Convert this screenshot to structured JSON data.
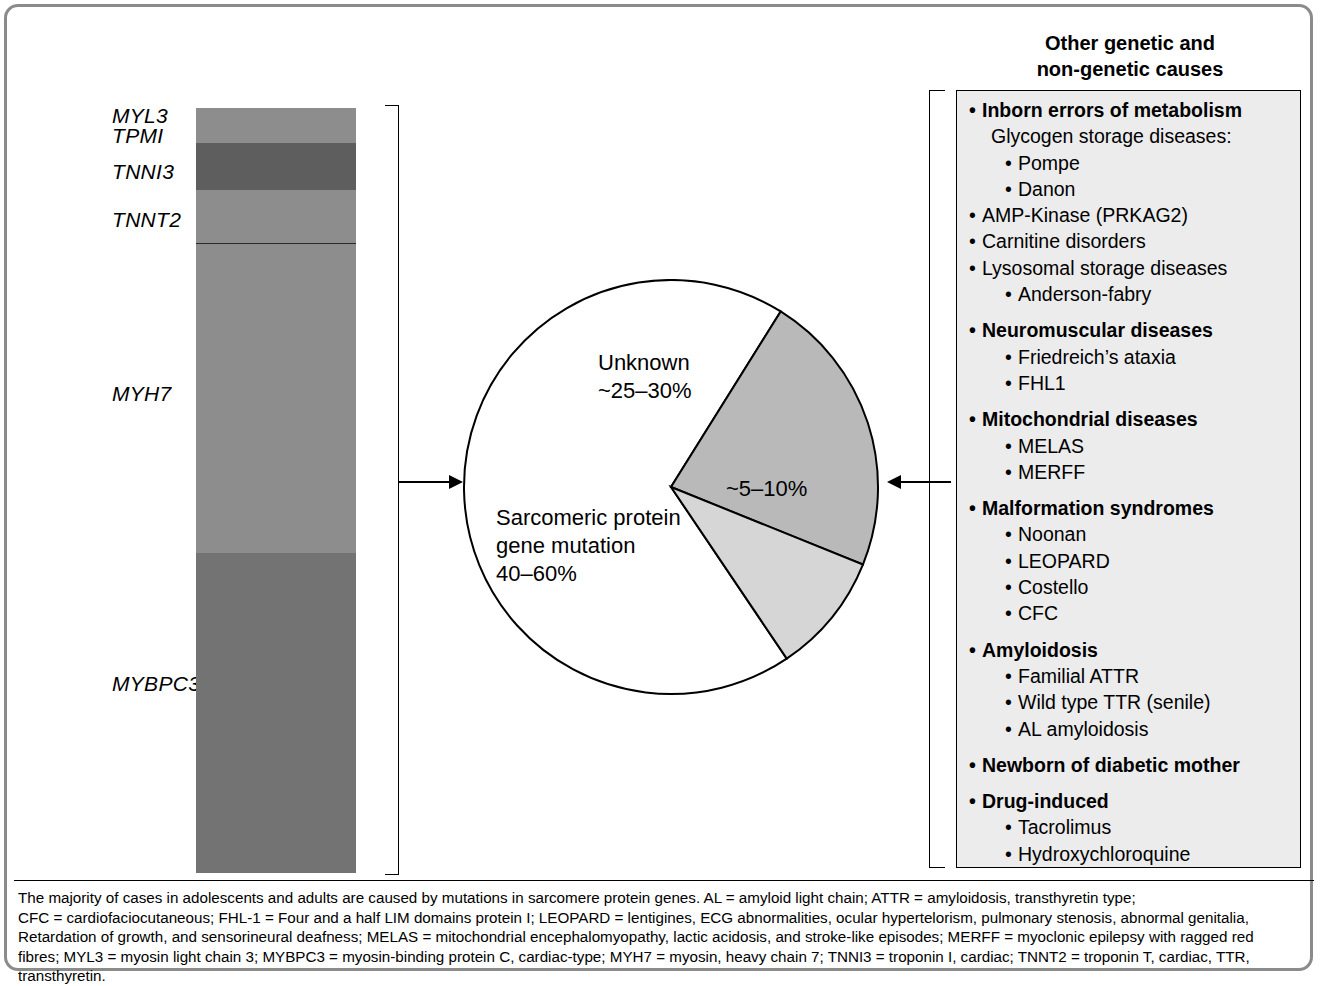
{
  "panel": {
    "title_line1": "Other genetic and",
    "title_line2": "non-genetic causes"
  },
  "colors": {
    "frame_border": "#8b8b8b",
    "bar_medium": "#8d8d8d",
    "bar_dark": "#5e5e5e",
    "bar_darker": "#737373",
    "pie_unknown": "#b9b9b9",
    "pie_other": "#d6d6d6",
    "pie_sarcomeric": "#ffffff",
    "panel_fill": "#ececec",
    "stroke": "#000000"
  },
  "chart_data": [
    {
      "type": "bar",
      "orientation": "vertical-stacked",
      "title": "",
      "xlabel": "",
      "ylabel": "",
      "categories": [
        "MYBPC3",
        "MYH7",
        "TNNT2",
        "TNNI3",
        "MYL3",
        "TPM1"
      ],
      "note": "Stacked single bar showing relative contribution of sarcomeric protein genes",
      "segments": [
        {
          "label": "MYL3",
          "label2": "TPM1",
          "share_pct": 4.6,
          "color": "#8d8d8d",
          "top_px": 108,
          "bottom_px": 143
        },
        {
          "label": "TNNI3",
          "share_pct": 6.1,
          "color": "#5e5e5e",
          "top_px": 143,
          "bottom_px": 190
        },
        {
          "label": "TNNT2",
          "share_pct": 6.9,
          "color": "#8d8d8d",
          "top_px": 190,
          "bottom_px": 243
        },
        {
          "label": "MYH7",
          "share_pct": 40.4,
          "color": "#8d8d8d",
          "top_px": 243,
          "bottom_px": 552
        },
        {
          "label": "MYBPC3",
          "share_pct": 41.9,
          "color": "#737373",
          "top_px": 552,
          "bottom_px": 872
        }
      ]
    },
    {
      "type": "pie",
      "title": "",
      "legend_position": "in-slice",
      "slices": [
        {
          "name": "Sarcomeric protein gene mutation",
          "value_label": "40–60%",
          "label_lines": [
            "Sarcomeric protein",
            "gene mutation",
            "40–60%"
          ],
          "share_pct": 62,
          "color": "#ffffff",
          "start_deg": 56,
          "end_deg": 302
        },
        {
          "name": "Unknown",
          "value_label": "~25–30%",
          "label_lines": [
            "Unknown",
            "~25–30%"
          ],
          "share_pct": 28,
          "color": "#b9b9b9",
          "start_deg": 302,
          "end_deg": 22
        },
        {
          "name": "Other",
          "value_label": "~5–10%",
          "label_lines": [
            "~5–10%"
          ],
          "share_pct": 10,
          "color": "#d6d6d6",
          "start_deg": 22,
          "end_deg": 56
        }
      ]
    }
  ],
  "bar_labels": [
    {
      "text": "MYL3",
      "x": 112,
      "y": 104
    },
    {
      "text": "TPMI",
      "x": 112,
      "y": 124
    },
    {
      "text": "TNNI3",
      "x": 112,
      "y": 160
    },
    {
      "text": "TNNT2",
      "x": 112,
      "y": 208
    },
    {
      "text": "MYH7",
      "x": 112,
      "y": 382
    },
    {
      "text": "MYBPC3",
      "x": 112,
      "y": 672
    }
  ],
  "pie_labels": [
    {
      "lines": [
        "Unknown",
        "~25–30%"
      ],
      "x": 136,
      "y": 70,
      "align": "left"
    },
    {
      "lines": [
        "~5–10%"
      ],
      "x": 264,
      "y": 196,
      "align": "left"
    },
    {
      "lines": [
        "Sarcomeric protein",
        "gene mutation",
        "40–60%"
      ],
      "x": 34,
      "y": 225,
      "align": "left"
    }
  ],
  "causes": [
    {
      "level": 0,
      "text": "Inborn errors of metabolism",
      "bullet": true
    },
    {
      "level": 1,
      "text": "Glycogen storage diseases:",
      "bullet": false
    },
    {
      "level": 2,
      "text": "Pompe",
      "bullet": true
    },
    {
      "level": 2,
      "text": "Danon",
      "bullet": true
    },
    {
      "level": 0,
      "text": "AMP-Kinase (PRKAG2)",
      "bullet": true,
      "bold": false
    },
    {
      "level": 0,
      "text": "Carnitine disorders",
      "bullet": true,
      "bold": false
    },
    {
      "level": 0,
      "text": "Lysosomal storage diseases",
      "bullet": true,
      "bold": false
    },
    {
      "level": 2,
      "text": "Anderson-fabry",
      "bullet": true
    },
    {
      "level": -1,
      "text": "",
      "bullet": false
    },
    {
      "level": 0,
      "text": "Neuromuscular diseases",
      "bullet": true
    },
    {
      "level": 2,
      "text": "Friedreich’s ataxia",
      "bullet": true
    },
    {
      "level": 2,
      "text": "FHL1",
      "bullet": true
    },
    {
      "level": -1,
      "text": "",
      "bullet": false
    },
    {
      "level": 0,
      "text": "Mitochondrial diseases",
      "bullet": true
    },
    {
      "level": 2,
      "text": "MELAS",
      "bullet": true
    },
    {
      "level": 2,
      "text": "MERFF",
      "bullet": true
    },
    {
      "level": -1,
      "text": "",
      "bullet": false
    },
    {
      "level": 0,
      "text": "Malformation syndromes",
      "bullet": true
    },
    {
      "level": 2,
      "text": "Noonan",
      "bullet": true
    },
    {
      "level": 2,
      "text": "LEOPARD",
      "bullet": true
    },
    {
      "level": 2,
      "text": "Costello",
      "bullet": true
    },
    {
      "level": 2,
      "text": "CFC",
      "bullet": true
    },
    {
      "level": -1,
      "text": "",
      "bullet": false
    },
    {
      "level": 0,
      "text": "Amyloidosis",
      "bullet": true
    },
    {
      "level": 2,
      "text": "Familial ATTR",
      "bullet": true
    },
    {
      "level": 2,
      "text": "Wild type TTR (senile)",
      "bullet": true
    },
    {
      "level": 2,
      "text": "AL amyloidosis",
      "bullet": true
    },
    {
      "level": -1,
      "text": "",
      "bullet": false
    },
    {
      "level": 0,
      "text": "Newborn of diabetic mother",
      "bullet": true
    },
    {
      "level": -1,
      "text": "",
      "bullet": false
    },
    {
      "level": 0,
      "text": "Drug-induced",
      "bullet": true
    },
    {
      "level": 2,
      "text": "Tacrolimus",
      "bullet": true
    },
    {
      "level": 2,
      "text": "Hydroxychloroquine",
      "bullet": true
    },
    {
      "level": 2,
      "text": "Steroids",
      "bullet": true
    }
  ],
  "caption": {
    "lines": [
      "The majority of cases in adolescents and adults are caused by mutations in sarcomere protein genes. AL = amyloid light chain; ATTR = amyloidosis, transthyretin type;",
      "CFC = cardiofaciocutaneous; FHL-1 = Four and a half LIM domains protein I; LEOPARD = lentigines, ECG abnormalities, ocular hypertelorism, pulmonary stenosis, abnormal genitalia,",
      "Retardation of growth, and sensorineural deafness; MELAS = mitochondrial encephalomyopathy, lactic acidosis, and stroke-like episodes; MERFF = myoclonic epilepsy with ragged red",
      "fibres; MYL3 = myosin light chain 3; MYBPC3 = myosin-binding protein C, cardiac-type; MYH7 = myosin, heavy chain 7; TNNI3 = troponin I, cardiac; TNNT2 = troponin T, cardiac, TTR,",
      "transthyretin."
    ]
  }
}
